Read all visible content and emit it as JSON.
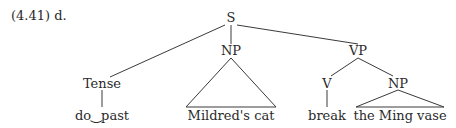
{
  "example_label": "(4.41) d.",
  "tree": {
    "root": "S",
    "subject": "NP",
    "predicate": "VP",
    "tense": "Tense",
    "verb": "V",
    "object": "NP",
    "leaves": {
      "tense": "do‿past",
      "subject": "Mildred's cat",
      "verb": "break",
      "object": "the Ming vase"
    }
  }
}
